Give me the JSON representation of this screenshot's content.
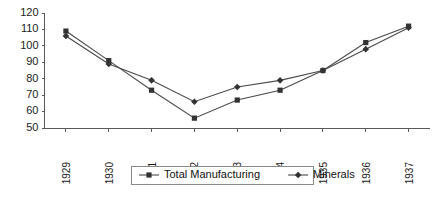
{
  "chart_data": {
    "type": "line",
    "title": "",
    "xlabel": "",
    "ylabel": "",
    "categories": [
      "1929",
      "1930",
      "1931",
      "1932",
      "1933",
      "1934",
      "1935",
      "1936",
      "1937"
    ],
    "ylim": [
      50,
      120
    ],
    "yticks": [
      50,
      60,
      70,
      80,
      90,
      100,
      110,
      120
    ],
    "ytick_labels": [
      "50",
      "60",
      "70",
      "80",
      "90",
      "100",
      "110",
      "120"
    ],
    "grid": false,
    "legend_position": "bottom",
    "series": [
      {
        "name": "Total Manufacturing",
        "marker": "square",
        "color": "#4a4a4a",
        "values": [
          109,
          91,
          73,
          56,
          67,
          73,
          85,
          102,
          112
        ]
      },
      {
        "name": "Minerals",
        "marker": "diamond",
        "color": "#4a4a4a",
        "values": [
          106,
          89,
          79,
          66,
          75,
          79,
          85,
          98,
          111
        ]
      }
    ]
  },
  "legend": {
    "entries": [
      {
        "label": "Total Manufacturing",
        "marker": "square"
      },
      {
        "label": "Minerals",
        "marker": "diamond"
      }
    ]
  },
  "colors": {
    "background": "#ffffff",
    "axis": "#5a5a5a",
    "line": "#4a4a4a",
    "marker": "#333333",
    "text": "#1c1c1c",
    "legend_border": "#8a8a8a"
  }
}
